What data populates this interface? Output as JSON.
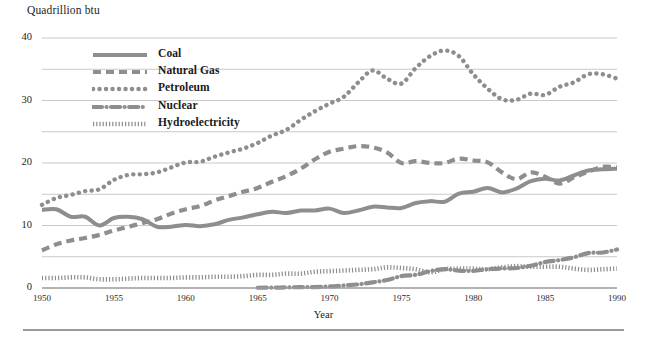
{
  "axes": {
    "y_unit_label": "Quadrillion btu",
    "x_axis_title": "Year",
    "y_ticks": [
      "0",
      "10",
      "20",
      "30",
      "40"
    ],
    "x_ticks": [
      "1950",
      "1955",
      "1960",
      "1965",
      "1970",
      "1975",
      "1980",
      "1985",
      "1990"
    ]
  },
  "legend": {
    "items": [
      {
        "label": "Coal",
        "swatch": "solid-line-swatch"
      },
      {
        "label": "Natural Gas",
        "swatch": "dashed-line-swatch"
      },
      {
        "label": "Petroleum",
        "swatch": "dotted-line-swatch"
      },
      {
        "label": "Nuclear",
        "swatch": "dash-dot-line-swatch"
      },
      {
        "label": "Hydroelectricity",
        "swatch": "fine-dotted-line-swatch"
      }
    ]
  },
  "colors": {
    "line": "#8e8e8e",
    "gridline": "#c9c9c9",
    "axis": "#9a9a9a",
    "text": "#1a1a1a"
  },
  "chart_data": {
    "type": "line",
    "title": "",
    "subtitle": "",
    "xlabel": "Year",
    "ylabel": "Quadrillion btu",
    "xlim": [
      1950,
      1990
    ],
    "ylim": [
      0,
      40
    ],
    "y_major_ticks": [
      0,
      10,
      20,
      30,
      40
    ],
    "y_minor_gridlines": [
      5,
      15,
      25,
      35
    ],
    "x_ticks": [
      1950,
      1955,
      1960,
      1965,
      1970,
      1975,
      1980,
      1985,
      1990
    ],
    "grid": true,
    "legend_position": "upper-left-inside",
    "x": [
      1950,
      1951,
      1952,
      1953,
      1954,
      1955,
      1956,
      1957,
      1958,
      1959,
      1960,
      1961,
      1962,
      1963,
      1964,
      1965,
      1966,
      1967,
      1968,
      1969,
      1970,
      1971,
      1972,
      1973,
      1974,
      1975,
      1976,
      1977,
      1978,
      1979,
      1980,
      1981,
      1982,
      1983,
      1984,
      1985,
      1986,
      1987,
      1988,
      1989,
      1990
    ],
    "series": [
      {
        "name": "Coal",
        "style": "solid",
        "values": [
          12.5,
          12.6,
          11.4,
          11.4,
          10.0,
          11.2,
          11.4,
          11.0,
          9.8,
          9.8,
          10.1,
          9.9,
          10.2,
          10.9,
          11.3,
          11.8,
          12.2,
          12.0,
          12.4,
          12.4,
          12.7,
          12.0,
          12.4,
          13.0,
          12.9,
          12.8,
          13.6,
          13.9,
          13.8,
          15.1,
          15.4,
          16.0,
          15.3,
          15.9,
          17.1,
          17.5,
          17.2,
          18.0,
          18.8,
          19.0,
          19.1
        ],
        "label": "Coal"
      },
      {
        "name": "Natural Gas",
        "style": "dashed",
        "values": [
          6.0,
          7.0,
          7.6,
          8.0,
          8.5,
          9.2,
          9.8,
          10.4,
          11.0,
          11.9,
          12.6,
          13.1,
          14.0,
          14.7,
          15.4,
          16.0,
          17.0,
          17.9,
          19.1,
          20.6,
          21.8,
          22.3,
          22.7,
          22.5,
          21.7,
          20.0,
          20.3,
          20.0,
          20.0,
          20.7,
          20.4,
          20.1,
          18.5,
          17.4,
          18.5,
          17.8,
          16.7,
          17.7,
          18.6,
          19.4,
          19.3
        ],
        "label": "Natural Gas"
      },
      {
        "name": "Petroleum",
        "style": "dotted",
        "values": [
          13.3,
          14.4,
          14.9,
          15.5,
          15.8,
          17.3,
          18.1,
          18.2,
          18.5,
          19.3,
          20.1,
          20.2,
          21.0,
          21.7,
          22.3,
          23.2,
          24.4,
          25.3,
          26.9,
          28.3,
          29.5,
          30.6,
          32.9,
          34.8,
          33.5,
          32.7,
          35.2,
          37.1,
          38.0,
          37.1,
          34.2,
          31.9,
          30.2,
          30.1,
          31.1,
          30.9,
          32.2,
          32.9,
          34.2,
          34.2,
          33.5
        ],
        "label": "Petroleum"
      },
      {
        "name": "Nuclear",
        "style": "dash-dot",
        "values": [
          0.0,
          0.0,
          0.0,
          0.0,
          0.0,
          0.0,
          0.0,
          0.0,
          0.0,
          0.0,
          0.0,
          0.0,
          0.0,
          0.0,
          0.0,
          0.04,
          0.06,
          0.09,
          0.14,
          0.15,
          0.24,
          0.41,
          0.58,
          0.91,
          1.27,
          1.9,
          2.11,
          2.7,
          3.02,
          2.78,
          2.74,
          3.01,
          3.13,
          3.2,
          3.55,
          4.15,
          4.47,
          4.91,
          5.59,
          5.68,
          6.16
        ],
        "label": "Nuclear"
      },
      {
        "name": "Hydroelectricity",
        "style": "fine-dotted",
        "values": [
          1.6,
          1.6,
          1.7,
          1.7,
          1.4,
          1.4,
          1.5,
          1.6,
          1.6,
          1.6,
          1.7,
          1.7,
          1.8,
          1.8,
          1.9,
          2.1,
          2.1,
          2.3,
          2.3,
          2.6,
          2.7,
          2.8,
          2.9,
          3.0,
          3.3,
          3.2,
          3.0,
          2.5,
          3.0,
          3.1,
          3.1,
          3.0,
          3.3,
          3.5,
          3.4,
          3.4,
          3.4,
          3.1,
          2.9,
          3.0,
          3.1
        ],
        "label": "Hydroelectricity"
      }
    ]
  }
}
